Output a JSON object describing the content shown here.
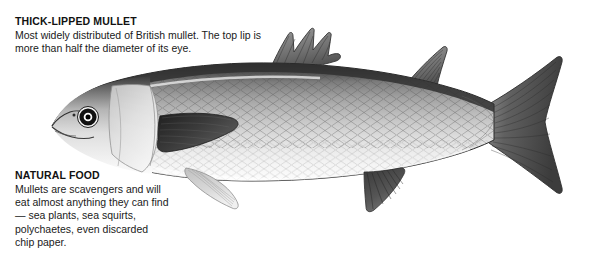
{
  "page": {
    "background_color": "#ffffff",
    "width": 598,
    "height": 261,
    "kind": "natural-history-illustration-plate"
  },
  "illustration": {
    "subject": "thick-lipped-mullet-fish",
    "orientation": "facing-left",
    "style": "grayscale-stipple-engraving",
    "colors": {
      "dorsal_dark": "#3b3b3b",
      "dorsal_mid": "#6e6e6e",
      "flank_mid": "#a8a8a8",
      "flank_light": "#d6d6d6",
      "belly_white": "#fbfbfb",
      "fin_dark": "#4a4a4a",
      "outline": "#2a2a2a",
      "eye_ring": "#1a1a1a",
      "eye_pupil": "#000000",
      "eye_highlight": "#ffffff"
    },
    "parts": [
      "head",
      "thick-upper-lip",
      "eye",
      "gill-cover",
      "pectoral-fin",
      "first-dorsal-fin",
      "second-dorsal-fin",
      "pelvic-fin",
      "anal-fin",
      "caudal-fin",
      "lateral-scales"
    ]
  },
  "species_note": {
    "heading": "THICK-LIPPED MULLET",
    "body_lines": [
      "Most widely distributed of British mullet. The top lip is",
      "more than half the diameter of its eye."
    ]
  },
  "food_note": {
    "heading": "NATURAL FOOD",
    "body_lines": [
      "Mullets are scavengers and will",
      "eat almost anything they can find",
      "— sea plants, sea squirts,",
      "polychaetes, even discarded",
      "chip paper."
    ]
  }
}
